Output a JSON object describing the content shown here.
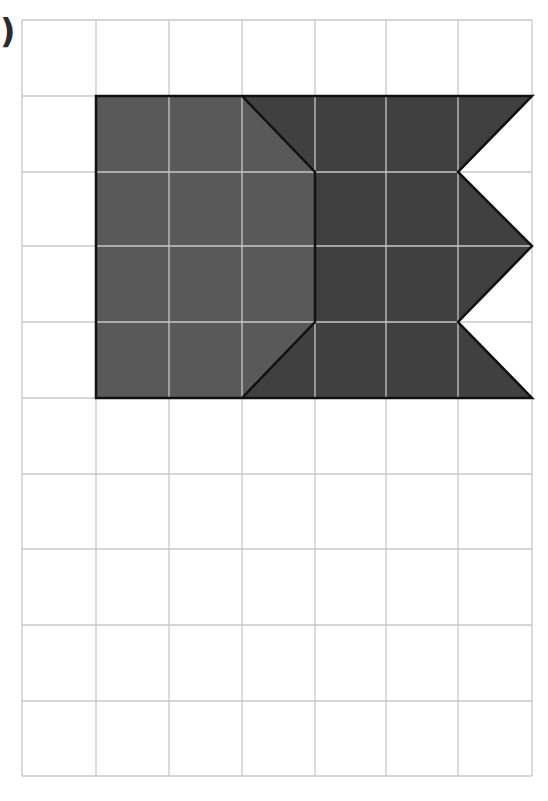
{
  "label": ")",
  "grid": {
    "columns": 7,
    "rows": 10,
    "x_lines": [
      22,
      96,
      169,
      242,
      315,
      386,
      458,
      532
    ],
    "y_lines": [
      20,
      96,
      172,
      246,
      322,
      398,
      474,
      549,
      625,
      701,
      776
    ],
    "line_color": "#c8c8c8",
    "inner_line_color_on_shape": "#c9c9c9"
  },
  "shapes": [
    {
      "name": "light-region",
      "fill": "#595959",
      "stroke": "#111111",
      "points": "96,96 242,96 315,172 315,322 242,398 96,398"
    },
    {
      "name": "dark-region",
      "fill": "#404040",
      "stroke": "#111111",
      "points": "242,96 532,96 458,172 532,246 458,322 532,398 242,398 315,322 315,172"
    }
  ],
  "outline": {
    "stroke": "#111111",
    "points": "96,96 532,96 458,172 532,246 458,322 532,398 96,398"
  },
  "divider": {
    "stroke": "#111111",
    "points": "242,96 315,172 315,322 242,398"
  }
}
